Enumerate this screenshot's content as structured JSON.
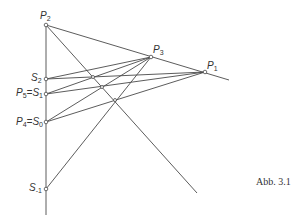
{
  "figure": {
    "caption": "Abb. 3.1",
    "line_color": "#4a4a4a",
    "points": {
      "P1": {
        "label": "P",
        "sub": "1",
        "x": 205,
        "y": 72
      },
      "P2": {
        "label": "P",
        "sub": "2",
        "x": 46,
        "y": 25
      },
      "P3": {
        "label": "P",
        "sub": "3",
        "x": 151,
        "y": 57
      },
      "S2": {
        "label": "S",
        "sub": "2",
        "x": 46,
        "y": 79
      },
      "S1": {
        "label": "P5 = S1",
        "x": 46,
        "y": 94
      },
      "S0": {
        "label": "P4 = S0",
        "x": 46,
        "y": 122
      },
      "Sm1": {
        "label": "S",
        "sub": "-1",
        "x": 46,
        "y": 189
      }
    },
    "labels": {
      "p2": "P",
      "p2_sub": "2",
      "p3": "P",
      "p3_sub": "3",
      "p1": "P",
      "p1_sub": "1",
      "s2": "S",
      "s2_sub": "2",
      "p5": "P",
      "p5_sub": "5",
      "s1": "S",
      "s1_sub": "1",
      "p4": "P",
      "p4_sub": "4",
      "s0": "S",
      "s0_sub": "0",
      "sm1": "S",
      "sm1_sub": "-1",
      "eq": "="
    }
  }
}
